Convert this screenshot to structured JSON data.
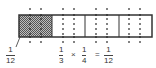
{
  "diagram": {
    "rectangle": {
      "x": 19,
      "y": 15,
      "width": 133,
      "height": 22,
      "divisions": 4
    },
    "shaded_section": {
      "index": 0,
      "fraction_of_whole": "1/12"
    },
    "dot_rows_y": [
      9,
      15,
      19,
      24,
      29,
      34,
      37,
      42
    ],
    "dot_columns_x": [
      30,
      41,
      63,
      74,
      96,
      107,
      129,
      140
    ],
    "dot_columns_note": "columns at x=129 and x=140 (fourth section) are extrapolated, not measured"
  },
  "labels": {
    "callout": {
      "numerator": "1",
      "denominator": "12"
    },
    "equation": {
      "term1": {
        "numerator": "1",
        "denominator": "3"
      },
      "times": "×",
      "term2": {
        "numerator": "1",
        "denominator": "4"
      },
      "equals": "=",
      "result": {
        "numerator": "1",
        "denominator": "12"
      }
    }
  },
  "colors": {
    "outline": "#333333",
    "shade": "#888888",
    "dot": "#222222"
  }
}
